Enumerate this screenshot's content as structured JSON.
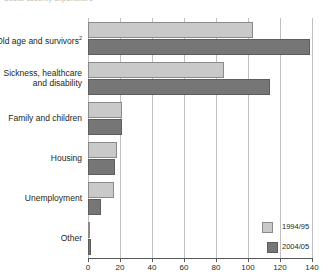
{
  "header": {
    "clipped_title": "Social security expenditure"
  },
  "legend": {
    "position": "bottom-right",
    "entries": [
      {
        "label": "1994/95",
        "color": "#c9c9c9"
      },
      {
        "label": "2004/05",
        "color": "#767676"
      }
    ]
  },
  "axis": {
    "ticks": [
      "0",
      "20",
      "40",
      "60",
      "80",
      "100",
      "120",
      "140"
    ],
    "min": 0,
    "max": 140,
    "step": 20
  },
  "chart_data": {
    "type": "bar",
    "orientation": "horizontal",
    "title": "Social security expenditure",
    "xlabel": "",
    "ylabel": "",
    "xlim": [
      0,
      140
    ],
    "grid": true,
    "legend_position": "bottom-right",
    "categories": [
      "Old age and survivors",
      "Sickness, healthcare\nand disability",
      "Family and children",
      "Housing",
      "Unemployment",
      "Other"
    ],
    "category_footnotes": [
      "2",
      "",
      "",
      "",
      "",
      ""
    ],
    "series": [
      {
        "name": "1994/95",
        "color": "#c9c9c9",
        "values": [
          103,
          85,
          21,
          18,
          16,
          1
        ]
      },
      {
        "name": "2004/05",
        "color": "#767676",
        "values": [
          139,
          114,
          21,
          17,
          8,
          2
        ]
      }
    ]
  }
}
